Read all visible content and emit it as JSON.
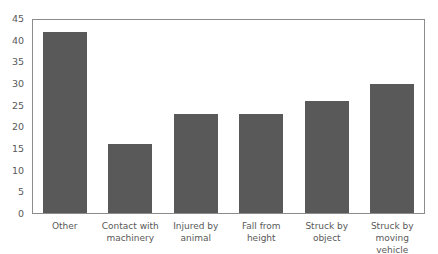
{
  "chart_data": {
    "type": "bar",
    "title": "",
    "xlabel": "",
    "ylabel": "",
    "categories": [
      "Other",
      "Contact with machinery",
      "Injured by animal",
      "Fall from height",
      "Struck by object",
      "Struck by moving vehicle"
    ],
    "category_lines": [
      [
        "Other"
      ],
      [
        "Contact with",
        "machinery"
      ],
      [
        "Injured by",
        "animal"
      ],
      [
        "Fall from height"
      ],
      [
        "Struck by",
        "object"
      ],
      [
        "Struck by",
        "moving vehicle"
      ]
    ],
    "values": [
      42,
      16,
      23,
      23,
      26,
      30
    ],
    "ylim": [
      0,
      45
    ],
    "yticks": [
      0,
      5,
      10,
      15,
      20,
      25,
      30,
      35,
      40,
      45
    ],
    "grid": false,
    "legend": null,
    "bar_color": "#595959"
  }
}
